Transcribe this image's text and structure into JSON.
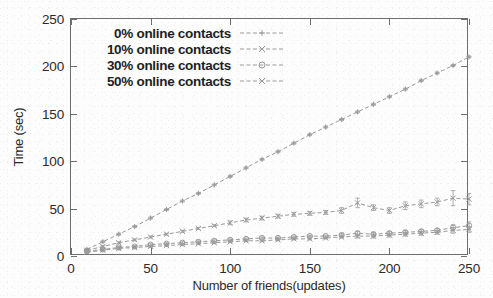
{
  "chart_data": {
    "type": "line",
    "title": "",
    "xlabel": "Number of friends(updates)",
    "ylabel": "Time (sec)",
    "xlim": [
      0,
      250
    ],
    "ylim": [
      0,
      250
    ],
    "xticks": [
      0,
      50,
      100,
      150,
      200,
      250
    ],
    "yticks": [
      0,
      50,
      100,
      150,
      200,
      250
    ],
    "grid": false,
    "legend_position": "top-left inside axes",
    "x": [
      10,
      20,
      30,
      40,
      50,
      60,
      70,
      80,
      90,
      100,
      110,
      120,
      130,
      140,
      150,
      160,
      170,
      180,
      190,
      200,
      210,
      220,
      230,
      240,
      250
    ],
    "series": [
      {
        "name": "0% online contacts",
        "marker": "plus",
        "linestyle": "dashed",
        "values": [
          7,
          15,
          23,
          31,
          40,
          49,
          58,
          66,
          75,
          84,
          93,
          102,
          110,
          119,
          128,
          136,
          144,
          152,
          160,
          168,
          176,
          185,
          193,
          201,
          210
        ],
        "errors": [
          1,
          1,
          1,
          1,
          1,
          1,
          1,
          1,
          1,
          1,
          1,
          1,
          1,
          1,
          1,
          1,
          1,
          1,
          1,
          1,
          1,
          1,
          1,
          1,
          1
        ]
      },
      {
        "name": "10% online contacts",
        "marker": "cross",
        "linestyle": "dashed",
        "values": [
          6,
          10,
          14,
          17,
          20,
          23,
          26,
          29,
          32,
          35,
          38,
          40,
          42,
          44,
          45,
          46,
          48,
          56,
          51,
          48,
          53,
          55,
          57,
          61,
          60
        ],
        "errors": [
          1,
          1,
          1,
          1,
          1,
          1,
          1,
          1,
          1,
          2,
          2,
          2,
          2,
          2,
          2,
          2,
          3,
          5,
          3,
          3,
          4,
          4,
          4,
          8,
          6
        ]
      },
      {
        "name": "30% online contacts",
        "marker": "circle",
        "linestyle": "dashed",
        "values": [
          5,
          7,
          9,
          10,
          12,
          13,
          14,
          15,
          16,
          17,
          18,
          19,
          19,
          20,
          21,
          21,
          22,
          24,
          23,
          24,
          25,
          26,
          27,
          30,
          32
        ],
        "errors": [
          1,
          1,
          1,
          1,
          1,
          1,
          1,
          1,
          1,
          1,
          1,
          1,
          1,
          1,
          1,
          1,
          2,
          2,
          2,
          2,
          2,
          2,
          2,
          3,
          4
        ]
      },
      {
        "name": "50% online contacts",
        "marker": "x",
        "linestyle": "dashed",
        "values": [
          4,
          6,
          8,
          9,
          10,
          11,
          12,
          13,
          14,
          15,
          16,
          16,
          17,
          18,
          18,
          19,
          20,
          21,
          21,
          22,
          23,
          24,
          25,
          27,
          28
        ],
        "errors": [
          1,
          1,
          1,
          1,
          1,
          1,
          1,
          1,
          1,
          1,
          1,
          1,
          1,
          1,
          1,
          1,
          1,
          2,
          2,
          2,
          2,
          2,
          2,
          3,
          3
        ]
      }
    ]
  },
  "axes": {
    "y_tick_labels": [
      "0",
      "50",
      "100",
      "150",
      "200",
      "250"
    ],
    "x_tick_labels": [
      "0",
      "50",
      "100",
      "150",
      "200",
      "250"
    ],
    "y_title": "Time (sec)",
    "x_title": "Number of friends(updates)"
  },
  "legend": {
    "entries": [
      {
        "label": "0% online contacts",
        "marker": "plus-marker"
      },
      {
        "label": "10% online contacts",
        "marker": "cross-marker"
      },
      {
        "label": "30% online contacts",
        "marker": "circle-marker"
      },
      {
        "label": "50% online contacts",
        "marker": "x-marker"
      }
    ]
  },
  "style": {
    "line_color": "#9a9a9a",
    "frame_color": "#6e6e6e",
    "text_color": "#2b2b2b",
    "background": "#fdfdfd"
  }
}
